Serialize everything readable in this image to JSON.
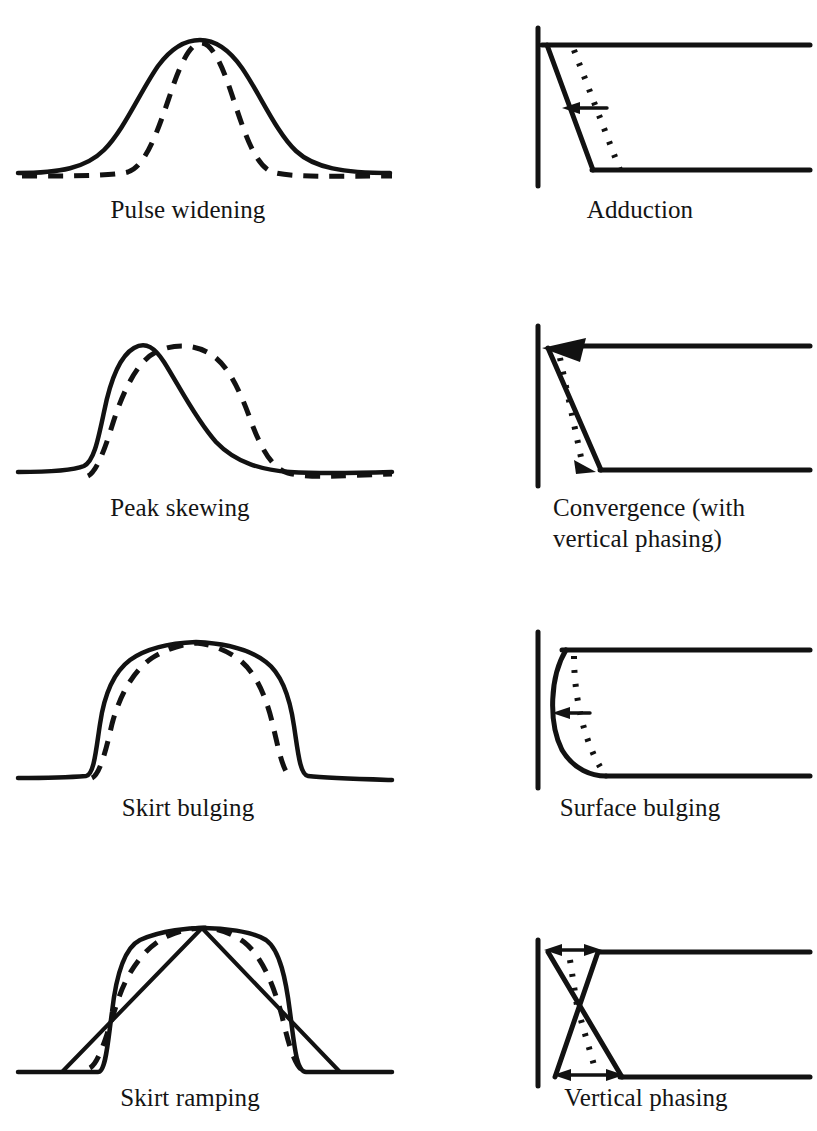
{
  "figure": {
    "type": "diagram",
    "background_color": "#ffffff",
    "ink_color": "#121212",
    "columns": 2,
    "rows": 4,
    "left_column_role": "pulse waveform distortion",
    "right_column_role": "surface geometry interpretation"
  },
  "style": {
    "solid_label": "observed / distorted trace",
    "dashed_label": "reference / undistorted trace",
    "dotted_label": "reference surface position"
  },
  "panels": [
    {
      "id": "pulse-widening",
      "caption": "Pulse widening",
      "caption_lines": [
        "Pulse widening"
      ],
      "column": "left",
      "row": 1,
      "kind": "waveform",
      "curves": [
        "solid-broad-bell",
        "dashed-narrow-bell"
      ]
    },
    {
      "id": "adduction",
      "caption": "Adduction",
      "caption_lines": [
        "Adduction"
      ],
      "column": "right",
      "row": 1,
      "kind": "geometry",
      "elements": [
        "vertical-axis",
        "top-horizontal",
        "bottom-horizontal",
        "solid-slant",
        "dotted-slant",
        "left-arrow"
      ]
    },
    {
      "id": "peak-skewing",
      "caption": "Peak skewing",
      "caption_lines": [
        "Peak skewing"
      ],
      "column": "left",
      "row": 2,
      "kind": "waveform",
      "curves": [
        "solid-left-skewed-bell",
        "dashed-right-shifted-bell"
      ]
    },
    {
      "id": "convergence",
      "caption": "Convergence (with vertical phasing)",
      "caption_lines": [
        "Convergence (with",
        "vertical phasing)"
      ],
      "column": "right",
      "row": 2,
      "kind": "geometry",
      "elements": [
        "vertical-axis",
        "top-horizontal",
        "bottom-horizontal",
        "solid-slant",
        "dotted-slant",
        "large-left-arrow",
        "small-down-arrow"
      ]
    },
    {
      "id": "skirt-bulging",
      "caption": "Skirt bulging",
      "caption_lines": [
        "Skirt bulging"
      ],
      "column": "left",
      "row": 3,
      "kind": "waveform",
      "curves": [
        "solid-flat-top-bulged",
        "dashed-flat-top-narrow"
      ]
    },
    {
      "id": "surface-bulging",
      "caption": "Surface bulging",
      "caption_lines": [
        "Surface bulging"
      ],
      "column": "right",
      "row": 3,
      "kind": "geometry",
      "elements": [
        "vertical-axis",
        "top-horizontal",
        "bottom-horizontal",
        "solid-bulged-arc",
        "dotted-reference-arc",
        "left-arrow"
      ]
    },
    {
      "id": "skirt-ramping",
      "caption": "Skirt ramping",
      "caption_lines": [
        "Skirt ramping"
      ],
      "column": "left",
      "row": 4,
      "kind": "waveform",
      "curves": [
        "solid-flat-top",
        "solid-ramp-lines",
        "dashed-inner-trace"
      ]
    },
    {
      "id": "vertical-phasing",
      "caption": "Vertical phasing",
      "caption_lines": [
        "Vertical phasing"
      ],
      "column": "right",
      "row": 4,
      "kind": "geometry",
      "elements": [
        "vertical-axis",
        "top-horizontal",
        "bottom-horizontal",
        "bowtie-cross-lines",
        "dotted-slants",
        "top-double-arrow",
        "bottom-double-arrow"
      ]
    }
  ]
}
